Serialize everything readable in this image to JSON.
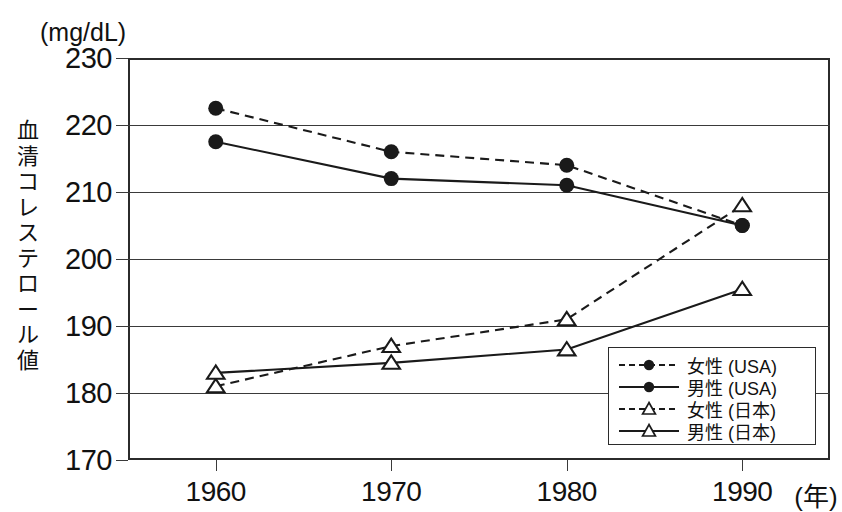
{
  "chart_data": {
    "type": "line",
    "title": "",
    "unit_label": "(mg/dL)",
    "ylabel": "血清コレステロール値",
    "xlabel": "",
    "x_unit": "(年)",
    "categories": [
      "1960",
      "1970",
      "1980",
      "1990"
    ],
    "x": [
      1960,
      1970,
      1980,
      1990
    ],
    "xlim": [
      1955,
      1995
    ],
    "ylim": [
      170,
      230
    ],
    "yticks": [
      "230",
      "220",
      "210",
      "200",
      "190",
      "180",
      "170"
    ],
    "ytick_values": [
      230,
      220,
      210,
      200,
      190,
      180,
      170
    ],
    "grid": true,
    "legend_position": "bottom-right",
    "series": [
      {
        "name": "女性 (USA)",
        "values": [
          222.5,
          216,
          214,
          205
        ],
        "line_style": "dashed",
        "marker": "filled-circle",
        "color": "#1a1a1a"
      },
      {
        "name": "男性 (USA)",
        "values": [
          217.5,
          212,
          211,
          205
        ],
        "line_style": "solid",
        "marker": "filled-circle",
        "color": "#1a1a1a"
      },
      {
        "name": "女性 (日本)",
        "values": [
          181,
          187,
          191,
          208
        ],
        "line_style": "dashed",
        "marker": "open-triangle",
        "color": "#1a1a1a"
      },
      {
        "name": "男性 (日本)",
        "values": [
          183,
          184.5,
          186.5,
          195.5
        ],
        "line_style": "solid",
        "marker": "open-triangle",
        "color": "#1a1a1a"
      }
    ]
  },
  "colors": {
    "axis": "#2b2b2b",
    "grid": "#3a3a3a",
    "ink": "#111111",
    "background": "#ffffff"
  }
}
